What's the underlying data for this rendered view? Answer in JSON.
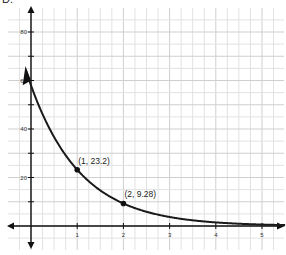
{
  "figure_label": "D.",
  "chart_data": {
    "type": "line",
    "title": "",
    "function": "y = 58(0.4)^x",
    "xlabel": "",
    "ylabel": "",
    "xlim": [
      -0.55,
      5.5
    ],
    "ylim": [
      -13,
      90
    ],
    "x_ticks": [
      "1",
      "2",
      "3",
      "4",
      "5"
    ],
    "y_ticks": [
      "20",
      "40",
      "60",
      "80"
    ],
    "grid": true,
    "series": [
      {
        "name": "exponential decay",
        "x": [
          -0.1,
          0,
          0.5,
          1,
          1.5,
          2,
          2.5,
          3,
          3.5,
          4,
          4.5,
          5,
          5.5
        ],
        "values": [
          63.0,
          58,
          36.7,
          23.2,
          14.7,
          9.28,
          5.87,
          3.71,
          2.35,
          1.48,
          0.94,
          0.59,
          0.38
        ]
      }
    ],
    "annotations": [
      {
        "x": 1,
        "y": 23.2,
        "text": "(1, 23.2)"
      },
      {
        "x": 2,
        "y": 9.28,
        "text": "(2, 9.28)"
      }
    ]
  }
}
